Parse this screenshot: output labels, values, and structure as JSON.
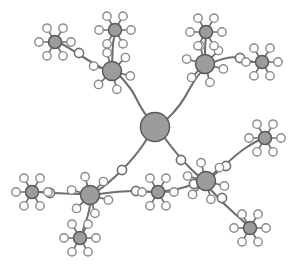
{
  "figure": {
    "type": "node-link-diagram",
    "width": 302,
    "height": 273,
    "background_color": "#ffffff"
  },
  "style": {
    "core_fill": "#9c9c9c",
    "core_stroke": "#5a5a5a",
    "leaf_fill": "#ffffff",
    "leaf_stroke": "#8a8a8a",
    "edge_stroke": "#6f6f6f",
    "edge_width": 2.1,
    "spoke_width": 1.7
  },
  "graph": {
    "node_count": 15,
    "leaf_count": 84,
    "link_bead_count": 9,
    "core_node_id": "C0",
    "nodes": [
      {
        "id": "C0",
        "label": "core",
        "x": 155,
        "y": 127,
        "r": 14.5,
        "kind": "core",
        "leaves": 0,
        "leaf_r": 0,
        "leaf_dist": 0,
        "leaf_start_deg": 0
      },
      {
        "id": "N1",
        "label": "upper-left-hub",
        "x": 112,
        "y": 71,
        "r": 9.5,
        "kind": "branch",
        "leaves": 6,
        "leaf_r": 4.2,
        "leaf_dist": 19,
        "leaf_start_deg": 15
      },
      {
        "id": "N2",
        "label": "top-left-terminal",
        "x": 115,
        "y": 30,
        "r": 6.5,
        "kind": "terminal",
        "leaves": 6,
        "leaf_r": 4.2,
        "leaf_dist": 16,
        "leaf_start_deg": 0
      },
      {
        "id": "N3",
        "label": "far-left-terminal",
        "x": 55,
        "y": 42,
        "r": 6.5,
        "kind": "terminal",
        "leaves": 6,
        "leaf_r": 4.2,
        "leaf_dist": 16,
        "leaf_start_deg": 0
      },
      {
        "id": "N4",
        "label": "upper-right-hub",
        "x": 205,
        "y": 64,
        "r": 9.5,
        "kind": "branch",
        "leaves": 6,
        "leaf_r": 4.2,
        "leaf_dist": 19,
        "leaf_start_deg": 15
      },
      {
        "id": "N5",
        "label": "top-right-terminal",
        "x": 206,
        "y": 32,
        "r": 6.5,
        "kind": "terminal",
        "leaves": 6,
        "leaf_r": 4.2,
        "leaf_dist": 16,
        "leaf_start_deg": 0
      },
      {
        "id": "N6",
        "label": "right-top-terminal",
        "x": 262,
        "y": 62,
        "r": 6.5,
        "kind": "terminal",
        "leaves": 6,
        "leaf_r": 4.2,
        "leaf_dist": 16,
        "leaf_start_deg": 0
      },
      {
        "id": "N7",
        "label": "lower-left-hub",
        "x": 90,
        "y": 195,
        "r": 9.5,
        "kind": "branch",
        "leaves": 6,
        "leaf_r": 4.2,
        "leaf_dist": 19,
        "leaf_start_deg": 15
      },
      {
        "id": "N8",
        "label": "left-terminal",
        "x": 32,
        "y": 192,
        "r": 6.5,
        "kind": "terminal",
        "leaves": 6,
        "leaf_r": 4.2,
        "leaf_dist": 16,
        "leaf_start_deg": 0
      },
      {
        "id": "N9",
        "label": "bottom-left-term",
        "x": 80,
        "y": 238,
        "r": 6.5,
        "kind": "terminal",
        "leaves": 6,
        "leaf_r": 4.2,
        "leaf_dist": 16,
        "leaf_start_deg": 0
      },
      {
        "id": "N10",
        "label": "mid-bottom-node",
        "x": 158,
        "y": 192,
        "r": 6.5,
        "kind": "terminal",
        "leaves": 6,
        "leaf_r": 4.2,
        "leaf_dist": 16,
        "leaf_start_deg": 0
      },
      {
        "id": "N11",
        "label": "lower-right-hub",
        "x": 206,
        "y": 181,
        "r": 9.5,
        "kind": "branch",
        "leaves": 6,
        "leaf_r": 4.2,
        "leaf_dist": 19,
        "leaf_start_deg": 15
      },
      {
        "id": "N12",
        "label": "right-mid-terminal",
        "x": 265,
        "y": 138,
        "r": 6.5,
        "kind": "terminal",
        "leaves": 6,
        "leaf_r": 4.2,
        "leaf_dist": 16,
        "leaf_start_deg": 0
      },
      {
        "id": "N13",
        "label": "bottom-right-term",
        "x": 250,
        "y": 228,
        "r": 6.5,
        "kind": "terminal",
        "leaves": 6,
        "leaf_r": 4.2,
        "leaf_dist": 16,
        "leaf_start_deg": 0
      }
    ],
    "edges": [
      {
        "id": "E1",
        "from": "C0",
        "to": "N1",
        "path": "M 146 115 C 138 104 136 96 130 88 C 124 80 120 76 118 74"
      },
      {
        "id": "E2",
        "from": "N1",
        "to": "N2",
        "path": "M 112 62 C 113 54 112 46 114 38"
      },
      {
        "id": "E3",
        "from": "N1",
        "to": "N3",
        "path": "M 102 68 C 94 64 88 60 80 55 C 72 50 66 46 62 44"
      },
      {
        "id": "E4",
        "from": "C0",
        "to": "N4",
        "path": "M 167 119 C 177 110 184 100 190 88 C 196 78 200 72 202 72"
      },
      {
        "id": "E5",
        "from": "N4",
        "to": "N5",
        "path": "M 205 55 C 205 48 205 42 206 38"
      },
      {
        "id": "E6",
        "from": "N4",
        "to": "N6",
        "path": "M 214 62 C 224 58 232 56 240 58 C 248 60 252 62 255 62"
      },
      {
        "id": "E7",
        "from": "C0",
        "to": "N7",
        "path": "M 147 139 C 140 150 132 160 122 170 C 112 180 102 188 97 191"
      },
      {
        "id": "E8",
        "from": "C0",
        "to": "N11",
        "path": "M 164 137 C 172 148 180 158 190 168 C 196 174 201 178 203 179"
      },
      {
        "id": "E9",
        "from": "N7",
        "to": "N8",
        "path": "M 81 194 C 70 194 60 193 50 193 C 44 193 41 192 39 192"
      },
      {
        "id": "E10",
        "from": "N7",
        "to": "N9",
        "path": "M 90 205 C 89 214 86 222 83 230"
      },
      {
        "id": "E11",
        "from": "N7",
        "to": "N10",
        "path": "M 99 194 C 112 192 124 191 136 191 C 146 191 152 192 152 192"
      },
      {
        "id": "E12",
        "from": "N10",
        "to": "N11",
        "path": "M 165 191 C 176 190 186 187 194 184 C 199 182 201 181 202 181"
      },
      {
        "id": "E13",
        "from": "N11",
        "to": "N12",
        "path": "M 214 175 C 224 166 234 156 244 149 C 253 143 259 140 261 139"
      },
      {
        "id": "E14",
        "from": "N11",
        "to": "N13",
        "path": "M 211 190 C 218 198 226 206 234 213 C 241 219 246 224 247 225"
      }
    ],
    "link_beads": [
      {
        "id": "B1",
        "label": "link-bead-upper-left",
        "x": 79,
        "y": 53,
        "r": 4.6
      },
      {
        "id": "B2",
        "label": "link-bead-center-left",
        "x": 122,
        "y": 170,
        "r": 4.6
      },
      {
        "id": "B3",
        "label": "link-bead-center-right",
        "x": 181,
        "y": 160,
        "r": 4.6
      },
      {
        "id": "B4",
        "label": "link-bead-bottom-mid",
        "x": 136,
        "y": 191,
        "r": 4.6
      },
      {
        "id": "B5",
        "label": "link-bead-bottom-right",
        "x": 194,
        "y": 184,
        "r": 4.6
      },
      {
        "id": "B6",
        "label": "link-bead-right-arc",
        "x": 226,
        "y": 166,
        "r": 4.6
      },
      {
        "id": "B7",
        "label": "link-bead-lower-right",
        "x": 222,
        "y": 198,
        "r": 4.6
      },
      {
        "id": "B8",
        "label": "link-bead-left-chain",
        "x": 50,
        "y": 193,
        "r": 4.6
      },
      {
        "id": "B9",
        "label": "link-bead-top-right",
        "x": 240,
        "y": 58,
        "r": 4.6
      }
    ]
  }
}
